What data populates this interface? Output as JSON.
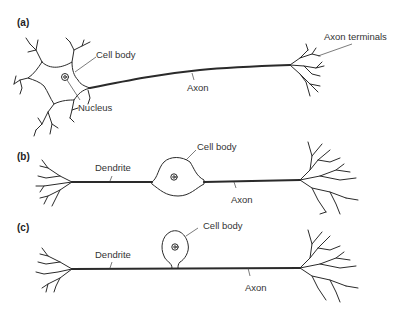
{
  "figure": {
    "panels": [
      {
        "id": "a",
        "label": "(a)",
        "labels": {
          "cell_body": "Cell body",
          "nucleus": "Nucleus",
          "axon": "Axon",
          "axon_terminals": "Axon terminals"
        }
      },
      {
        "id": "b",
        "label": "(b)",
        "labels": {
          "dendrite": "Dendrite",
          "cell_body": "Cell body",
          "axon": "Axon"
        }
      },
      {
        "id": "c",
        "label": "(c)",
        "labels": {
          "dendrite": "Dendrite",
          "cell_body": "Cell body",
          "axon": "Axon"
        }
      }
    ],
    "colors": {
      "line": "#2a2a2a",
      "text": "#333333",
      "background": "#ffffff"
    }
  }
}
